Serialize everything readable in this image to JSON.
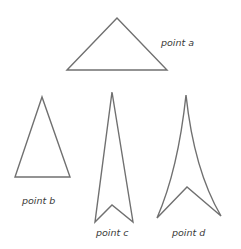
{
  "diagram": {
    "stroke_color": "#707070",
    "text_color": "#3a3a3a",
    "figures": [
      {
        "id": "a",
        "label": "point a",
        "shape": "obtuse-triangle",
        "points": [
          [
            67,
            70
          ],
          [
            117,
            18
          ],
          [
            167,
            70
          ]
        ]
      },
      {
        "id": "b",
        "label": "point b",
        "shape": "acute-triangle",
        "points": [
          [
            42,
            97
          ],
          [
            15,
            177
          ],
          [
            70,
            177
          ]
        ]
      },
      {
        "id": "c",
        "label": "point c",
        "shape": "concave-arrowhead",
        "points": [
          [
            112,
            92
          ],
          [
            95,
            222
          ],
          [
            112,
            205
          ],
          [
            133,
            222
          ]
        ]
      },
      {
        "id": "d",
        "label": "point d",
        "shape": "curved-concave-arrowhead",
        "points": [
          [
            186,
            95
          ],
          [
            157,
            218
          ],
          [
            187,
            187
          ],
          [
            221,
            216
          ]
        ]
      }
    ]
  }
}
